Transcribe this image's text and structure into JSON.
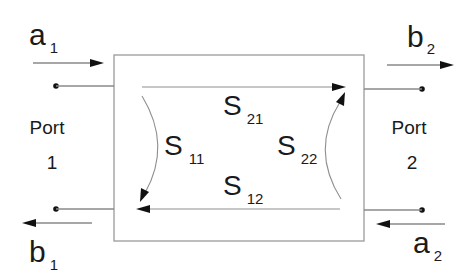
{
  "diagram": {
    "ports": [
      {
        "label": "Port",
        "number": "1"
      },
      {
        "label": "Port",
        "number": "2"
      }
    ],
    "waves": {
      "a1": {
        "main": "a",
        "sub": "1",
        "direction": "incident",
        "port": 1
      },
      "b1": {
        "main": "b",
        "sub": "1",
        "direction": "reflected",
        "port": 1
      },
      "a2": {
        "main": "a",
        "sub": "2",
        "direction": "incident",
        "port": 2
      },
      "b2": {
        "main": "b",
        "sub": "2",
        "direction": "reflected",
        "port": 2
      }
    },
    "s_params": {
      "s11": {
        "main": "S",
        "sub": "11"
      },
      "s21": {
        "main": "S",
        "sub": "21"
      },
      "s22": {
        "main": "S",
        "sub": "22"
      },
      "s12": {
        "main": "S",
        "sub": "12"
      }
    },
    "colors": {
      "text": "#1a1a1a",
      "lines": "#8a8a8a",
      "arrowheads": "#111111",
      "background": "#ffffff"
    }
  }
}
